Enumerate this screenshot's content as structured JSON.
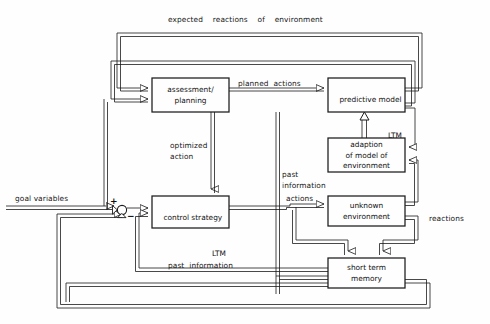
{
  "diagram": {
    "title_note": "expected reactions of environment",
    "blocks": [
      {
        "id": "assessment",
        "lines": [
          "assessment/",
          "planning"
        ],
        "x": 152,
        "y": 78,
        "w": 77,
        "h": 34,
        "align": "center"
      },
      {
        "id": "predictive",
        "lines": [
          "predictive model",
          "LTM"
        ],
        "x": 328,
        "y": 78,
        "w": 77,
        "h": 34,
        "align": "split"
      },
      {
        "id": "adaption",
        "lines": [
          "adaption",
          "of model of",
          "environment"
        ],
        "x": 328,
        "y": 138,
        "w": 77,
        "h": 34,
        "align": "center"
      },
      {
        "id": "unknown",
        "lines": [
          "unknown",
          "environment"
        ],
        "x": 328,
        "y": 196,
        "w": 77,
        "h": 30,
        "align": "center"
      },
      {
        "id": "control",
        "lines": [
          "control strategy",
          "LTM"
        ],
        "x": 152,
        "y": 196,
        "w": 77,
        "h": 32,
        "align": "split"
      },
      {
        "id": "stm",
        "lines": [
          "short term",
          "memory"
        ],
        "x": 328,
        "y": 258,
        "w": 77,
        "h": 30,
        "align": "center"
      }
    ],
    "edge_labels": [
      {
        "id": "expected-reactions",
        "text": "expected    reactions    of    environment",
        "x": 168,
        "y": 15
      },
      {
        "id": "planned-actions",
        "text": "planned  actions",
        "x": 238,
        "y": 79
      },
      {
        "id": "optimized-action",
        "text": "optimized\naction",
        "x": 170,
        "y": 141
      },
      {
        "id": "goal-variables",
        "text": "goal variables",
        "x": 15,
        "y": 194
      },
      {
        "id": "past-information-1",
        "text": "past\ninformation",
        "x": 282,
        "y": 170
      },
      {
        "id": "actions",
        "text": "actions",
        "x": 286,
        "y": 194
      },
      {
        "id": "reactions",
        "text": "reactions",
        "x": 429,
        "y": 214
      },
      {
        "id": "past-information-2",
        "text": "past  information",
        "x": 168,
        "y": 261
      }
    ],
    "junction": {
      "id": "summing-junction",
      "cx": 122,
      "cy": 210,
      "r": 4.6,
      "plus_label": "+",
      "minus_label": "−"
    },
    "colors": {
      "stroke": "#1b1b1b",
      "background": "#fefefe",
      "text": "#141414"
    }
  }
}
